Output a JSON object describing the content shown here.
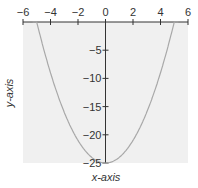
{
  "chart_data": {
    "type": "line",
    "title": "",
    "xlabel": "x-axis",
    "ylabel": "y-axis",
    "xlim": [
      -6,
      6
    ],
    "ylim": [
      -25,
      0
    ],
    "xticks": [
      -6,
      -4,
      -2,
      0,
      2,
      4,
      6
    ],
    "yticks": [
      -5,
      -10,
      -15,
      -20,
      -25
    ],
    "xtick_labels": [
      "−6",
      "−4",
      "−2",
      "0",
      "2",
      "4",
      "6"
    ],
    "ytick_labels": [
      "−5",
      "−10",
      "−15",
      "−20",
      "−25"
    ],
    "grid": false,
    "series": [
      {
        "name": "y = x² − 25",
        "x": [
          -5,
          -4,
          -3,
          -2,
          -1,
          0,
          1,
          2,
          3,
          4,
          5
        ],
        "y": [
          0,
          -9,
          -16,
          -21,
          -24,
          -25,
          -24,
          -21,
          -16,
          -9,
          0
        ]
      }
    ],
    "colors": {
      "background": "#f0f0f0",
      "curve": "#a8a8a8",
      "axis": "#333333"
    }
  }
}
